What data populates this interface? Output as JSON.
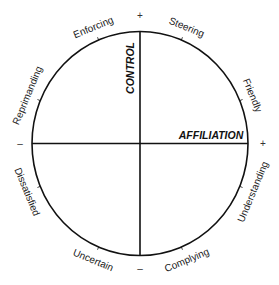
{
  "diagram": {
    "colors": {
      "line": "#111111",
      "text": "#1a1a1a"
    },
    "circle": {
      "cx": 140,
      "cy": 143.5,
      "rx": 108,
      "ry": 112
    },
    "axes": {
      "vertical": {
        "label": "CONTROL",
        "positive_sign": "+",
        "negative_sign": "–"
      },
      "horizontal": {
        "label": "AFFILIATION",
        "positive_sign": "+",
        "negative_sign": "–"
      }
    },
    "segments": [
      {
        "label": "Friendly",
        "angle": 22.5
      },
      {
        "label": "Steering",
        "angle": 67.5
      },
      {
        "label": "Enforcing",
        "angle": 112.5
      },
      {
        "label": "Reprimanding",
        "angle": 157.5
      },
      {
        "label": "Dissatisfied",
        "angle": 202.5
      },
      {
        "label": "Uncertain",
        "angle": 247.5
      },
      {
        "label": "Complying",
        "angle": 292.5
      },
      {
        "label": "Understanding",
        "angle": 337.5
      }
    ]
  }
}
